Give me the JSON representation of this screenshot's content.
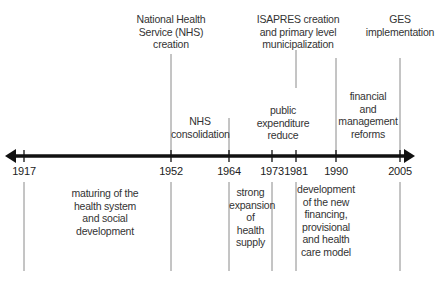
{
  "diagram": {
    "type": "timeline",
    "axis": {
      "start_year": "1917",
      "end_year": "2005",
      "arrows": "both"
    },
    "years": [
      {
        "label": "1917",
        "x": 24
      },
      {
        "label": "1952",
        "x": 171
      },
      {
        "label": "1964",
        "x": 229
      },
      {
        "label": "1973",
        "x": 272
      },
      {
        "label": "1981",
        "x": 296
      },
      {
        "label": "1990",
        "x": 336
      },
      {
        "label": "2005",
        "x": 400
      }
    ],
    "events_above": [
      {
        "id": "nhs-creation",
        "year": "1952",
        "text": "National Health\nService (NHS)\ncreation"
      },
      {
        "id": "isapres",
        "year": "1981",
        "text": "ISAPRES creation\nand primary level\nmunicipalization"
      },
      {
        "id": "ges",
        "year": "2005",
        "text": "GES\nimplementation"
      },
      {
        "id": "nhs-consolidation",
        "year": "1964",
        "text": "NHS\nconsolidation"
      },
      {
        "id": "public-expenditure",
        "year": "1973-1981",
        "text": "public\nexpenditure\nreduce"
      },
      {
        "id": "financial-reforms",
        "year": "1990-2005",
        "text": "financial\nand\nmanagement\nreforms"
      }
    ],
    "periods_below": [
      {
        "id": "maturing",
        "range": "1917-1952",
        "text": "maturing of the\nhealth system\nand social\ndevelopment"
      },
      {
        "id": "expansion",
        "range": "1964-1973",
        "text": "strong\nexpansion\nof\nhealth\nsupply"
      },
      {
        "id": "new-model",
        "range": "1981-2005",
        "text": "development\nof the new\nfinancing,\nprovisional\nand health\ncare model"
      }
    ],
    "colors": {
      "axis": "#111111",
      "guide_lines": "#8a8a8a",
      "text": "#333333"
    }
  }
}
